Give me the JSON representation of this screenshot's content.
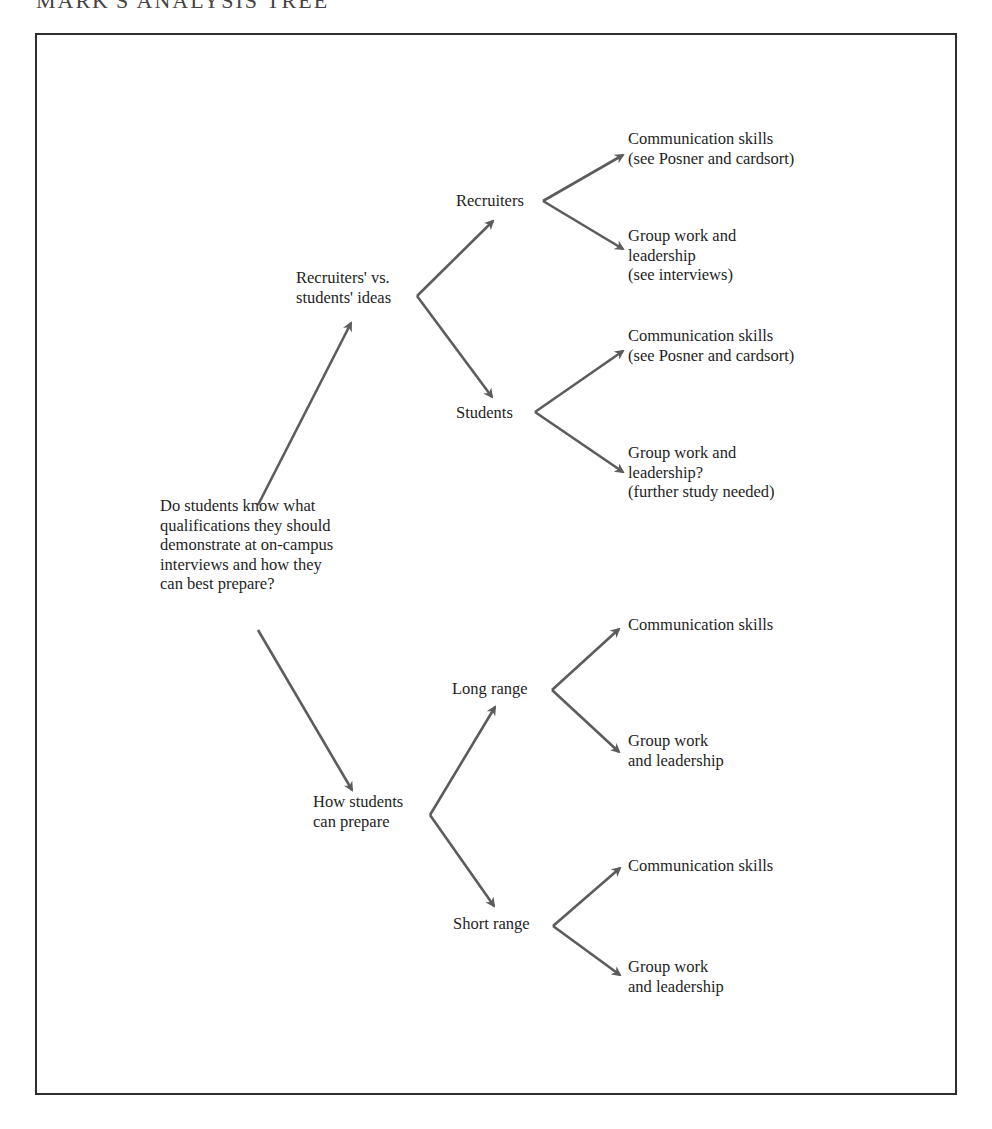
{
  "page": {
    "title": "MARK'S ANALYSIS TREE"
  },
  "tree": {
    "root": "Do students know what\nqualifications they should\ndemonstrate at on-campus\ninterviews and how they\ncan best prepare?",
    "branch_a": {
      "label": "Recruiters' vs.\nstudents' ideas",
      "recruiters": {
        "label": "Recruiters",
        "leaf_1": "Communication skills\n(see Posner and cardsort)",
        "leaf_2": "Group work and\nleadership\n(see interviews)"
      },
      "students": {
        "label": "Students",
        "leaf_1": "Communication skills\n(see Posner and cardsort)",
        "leaf_2": "Group work and\nleadership?\n(further study needed)"
      }
    },
    "branch_b": {
      "label": "How students\ncan prepare",
      "long_range": {
        "label": "Long range",
        "leaf_1": "Communication skills",
        "leaf_2": "Group work\nand leadership"
      },
      "short_range": {
        "label": "Short range",
        "leaf_1": "Communication skills",
        "leaf_2": "Group work\nand leadership"
      }
    }
  },
  "colors": {
    "arrow": "#5c5c5c",
    "frame": "#2e2e2e",
    "text": "#1e1e1e"
  }
}
